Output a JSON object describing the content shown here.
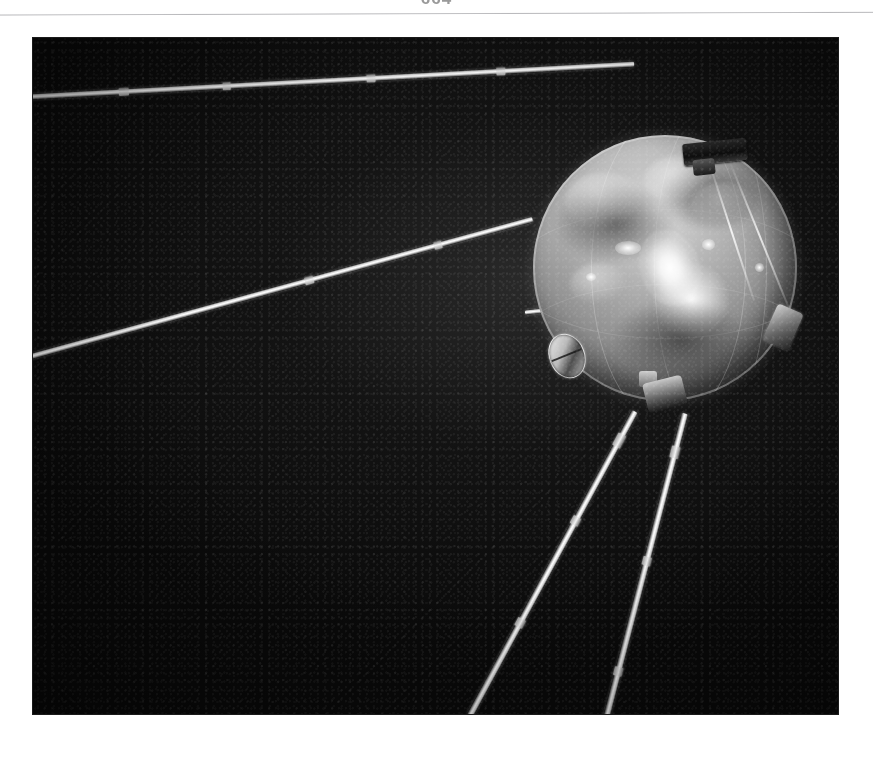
{
  "page": {
    "folio": "664",
    "background_color": "#ffffff",
    "rule_color": "#c3c3c6"
  },
  "figure": {
    "name": "sputnik-1-photograph",
    "caption": "",
    "alt": "Black-and-white photograph of the Sputnik 1 satellite: a polished metal sphere with four whip antennas against a dark background",
    "frame": {
      "x": 33,
      "y": 38,
      "width": 805,
      "height": 676,
      "background_color": "#0a0a0a"
    },
    "subject": {
      "label": "sputnik-1-sphere",
      "center_x": 664,
      "center_y": 267,
      "radius": 132,
      "body_color": "#9a9a9a",
      "highlight_color": "#ffffff",
      "shadow_color": "#343434"
    },
    "antennas": [
      {
        "label": "upper-left-antenna",
        "color": "#ffffff"
      },
      {
        "label": "mid-left-antenna",
        "color": "#f2f2f2"
      },
      {
        "label": "lower-antenna-a",
        "color": "#e8e8e8"
      },
      {
        "label": "lower-antenna-b",
        "color": "#e8e8e8"
      },
      {
        "label": "left-stub-antenna",
        "color": "#d8d8d8"
      }
    ],
    "details": [
      {
        "label": "top-antenna-mount",
        "color": "#1b1b1b"
      },
      {
        "label": "right-antenna-mount",
        "color": "#6a6a6a"
      },
      {
        "label": "bottom-antenna-mount",
        "color": "#5c5c5c"
      },
      {
        "label": "access-port",
        "color": "#b9b9b9"
      }
    ]
  }
}
